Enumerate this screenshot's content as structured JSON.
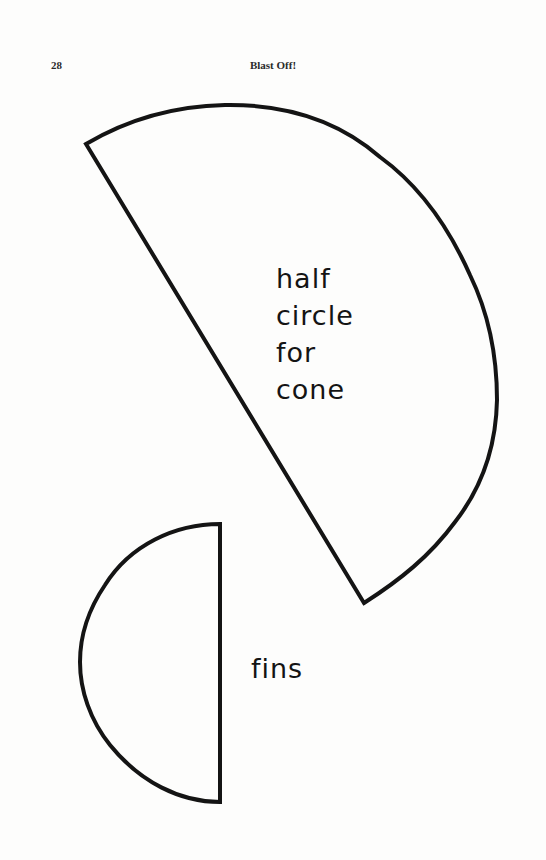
{
  "header": {
    "page_number": "28",
    "running_title": "Blast Off!"
  },
  "cone_template": {
    "shape": "half-circle",
    "label_lines": [
      "half",
      "circle",
      "for",
      "cone"
    ]
  },
  "fins_template": {
    "shape": "half-circle",
    "label": "fins"
  },
  "colors": {
    "page": "#fdfdfc",
    "ink": "#141414"
  }
}
